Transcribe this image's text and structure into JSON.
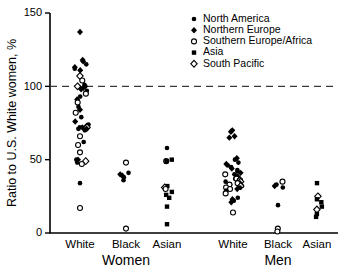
{
  "chart_data": {
    "type": "scatter",
    "title": "",
    "xlabel": "",
    "ylabel": "Ratio to U.S. White women, %",
    "ylim": [
      0,
      150
    ],
    "yticks": [
      0,
      50,
      100,
      150
    ],
    "ytick_labels": [
      "0",
      "50",
      "100",
      "150"
    ],
    "grid": false,
    "legend_position": "top-right",
    "reference_line": {
      "value": 100,
      "style": "dashed",
      "color": "#3a3a3a"
    },
    "group_labels": [
      "Women",
      "Men"
    ],
    "categories": [
      "White",
      "Black",
      "Asian",
      "White",
      "Black",
      "Asian"
    ],
    "category_groups": [
      "Women",
      "Women",
      "Women",
      "Men",
      "Men",
      "Men"
    ],
    "legend": [
      {
        "name": "North America",
        "marker": "filled-circle"
      },
      {
        "name": "Northern Europe",
        "marker": "filled-diamond"
      },
      {
        "name": "Southern Europe/Africa",
        "marker": "open-circle"
      },
      {
        "name": "Asia",
        "marker": "filled-square"
      },
      {
        "name": "South Pacific",
        "marker": "open-diamond"
      }
    ],
    "series": [
      {
        "name": "North America",
        "marker": "filled-circle",
        "points": [
          {
            "category": "Women-White",
            "value": 115
          },
          {
            "category": "Women-White",
            "value": 112
          },
          {
            "category": "Women-White",
            "value": 101
          },
          {
            "category": "Women-White",
            "value": 100
          },
          {
            "category": "Women-White",
            "value": 97
          },
          {
            "category": "Women-White",
            "value": 93
          },
          {
            "category": "Women-White",
            "value": 86
          },
          {
            "category": "Women-White",
            "value": 79
          },
          {
            "category": "Women-White",
            "value": 74
          },
          {
            "category": "Women-White",
            "value": 72
          },
          {
            "category": "Women-White",
            "value": 71
          },
          {
            "category": "Women-White",
            "value": 70
          },
          {
            "category": "Women-White",
            "value": 62
          },
          {
            "category": "Women-White",
            "value": 50
          },
          {
            "category": "Women-White",
            "value": 48
          },
          {
            "category": "Women-White",
            "value": 34
          },
          {
            "category": "Women-Black",
            "value": 41
          },
          {
            "category": "Women-Black",
            "value": 38
          },
          {
            "category": "Women-Black",
            "value": 36
          },
          {
            "category": "Women-Asian",
            "value": 58
          },
          {
            "category": "Men-White",
            "value": 50
          },
          {
            "category": "Men-White",
            "value": 48
          },
          {
            "category": "Men-White",
            "value": 46
          },
          {
            "category": "Men-White",
            "value": 45
          },
          {
            "category": "Men-White",
            "value": 43
          },
          {
            "category": "Men-White",
            "value": 42
          },
          {
            "category": "Men-White",
            "value": 40
          },
          {
            "category": "Men-White",
            "value": 39
          },
          {
            "category": "Men-White",
            "value": 38
          },
          {
            "category": "Men-White",
            "value": 37
          },
          {
            "category": "Men-White",
            "value": 36
          },
          {
            "category": "Men-White",
            "value": 35
          },
          {
            "category": "Men-White",
            "value": 33
          },
          {
            "category": "Men-White",
            "value": 32
          },
          {
            "category": "Men-White",
            "value": 31
          },
          {
            "category": "Men-White",
            "value": 29
          },
          {
            "category": "Men-White",
            "value": 24
          },
          {
            "category": "Men-White",
            "value": 22
          },
          {
            "category": "Men-Black",
            "value": 33
          },
          {
            "category": "Men-Black",
            "value": 31
          },
          {
            "category": "Men-Black",
            "value": 19
          }
        ]
      },
      {
        "name": "Northern Europe",
        "marker": "filled-diamond",
        "points": [
          {
            "category": "Women-White",
            "value": 137
          },
          {
            "category": "Women-White",
            "value": 118
          },
          {
            "category": "Women-White",
            "value": 117
          },
          {
            "category": "Women-White",
            "value": 113
          },
          {
            "category": "Women-White",
            "value": 111
          },
          {
            "category": "Women-White",
            "value": 99
          },
          {
            "category": "Women-White",
            "value": 98
          },
          {
            "category": "Women-White",
            "value": 91
          },
          {
            "category": "Women-White",
            "value": 84
          },
          {
            "category": "Women-White",
            "value": 76
          },
          {
            "category": "Women-White",
            "value": 73
          },
          {
            "category": "Women-White",
            "value": 72
          },
          {
            "category": "Women-White",
            "value": 71
          },
          {
            "category": "Women-White",
            "value": 50
          },
          {
            "category": "Women-Black",
            "value": 40
          },
          {
            "category": "Women-Black",
            "value": 39
          },
          {
            "category": "Men-White",
            "value": 70
          },
          {
            "category": "Men-White",
            "value": 69
          },
          {
            "category": "Men-White",
            "value": 66
          },
          {
            "category": "Men-White",
            "value": 65
          },
          {
            "category": "Men-White",
            "value": 51
          },
          {
            "category": "Men-White",
            "value": 47
          },
          {
            "category": "Men-White",
            "value": 44
          },
          {
            "category": "Men-White",
            "value": 41
          },
          {
            "category": "Men-White",
            "value": 38
          },
          {
            "category": "Men-White",
            "value": 34
          },
          {
            "category": "Men-White",
            "value": 30
          },
          {
            "category": "Men-White",
            "value": 23
          },
          {
            "category": "Men-White",
            "value": 21
          },
          {
            "category": "Men-Black",
            "value": 32
          }
        ]
      },
      {
        "name": "Southern Europe/Africa",
        "marker": "open-circle",
        "points": [
          {
            "category": "Women-White",
            "value": 104
          },
          {
            "category": "Women-White",
            "value": 95
          },
          {
            "category": "Women-White",
            "value": 89
          },
          {
            "category": "Women-White",
            "value": 82
          },
          {
            "category": "Women-White",
            "value": 66
          },
          {
            "category": "Women-White",
            "value": 60
          },
          {
            "category": "Women-White",
            "value": 55
          },
          {
            "category": "Women-White",
            "value": 47
          },
          {
            "category": "Women-White",
            "value": 17
          },
          {
            "category": "Women-Black",
            "value": 48
          },
          {
            "category": "Women-Black",
            "value": 3
          },
          {
            "category": "Women-Asian",
            "value": 49
          },
          {
            "category": "Women-Asian",
            "value": 30
          },
          {
            "category": "Men-White",
            "value": 40
          },
          {
            "category": "Men-White",
            "value": 37
          },
          {
            "category": "Men-White",
            "value": 36
          },
          {
            "category": "Men-White",
            "value": 34
          },
          {
            "category": "Men-White",
            "value": 33
          },
          {
            "category": "Men-White",
            "value": 31
          },
          {
            "category": "Men-White",
            "value": 30
          },
          {
            "category": "Men-White",
            "value": 27
          },
          {
            "category": "Men-White",
            "value": 14
          },
          {
            "category": "Men-Black",
            "value": 35
          },
          {
            "category": "Men-Black",
            "value": 3
          },
          {
            "category": "Men-Black",
            "value": 1
          }
        ]
      },
      {
        "name": "Asia",
        "marker": "filled-square",
        "points": [
          {
            "category": "Women-Asian",
            "value": 50
          },
          {
            "category": "Women-Asian",
            "value": 49
          },
          {
            "category": "Women-Asian",
            "value": 32
          },
          {
            "category": "Women-Asian",
            "value": 28
          },
          {
            "category": "Women-Asian",
            "value": 26
          },
          {
            "category": "Women-Asian",
            "value": 24
          },
          {
            "category": "Women-Asian",
            "value": 18
          },
          {
            "category": "Women-Asian",
            "value": 6
          },
          {
            "category": "Men-Asian",
            "value": 34
          },
          {
            "category": "Men-Asian",
            "value": 23
          },
          {
            "category": "Men-Asian",
            "value": 21
          },
          {
            "category": "Men-Asian",
            "value": 18
          },
          {
            "category": "Men-Asian",
            "value": 13
          },
          {
            "category": "Men-Asian",
            "value": 11
          }
        ]
      },
      {
        "name": "South Pacific",
        "marker": "open-diamond",
        "points": [
          {
            "category": "Women-White",
            "value": 107
          },
          {
            "category": "Women-White",
            "value": 100
          },
          {
            "category": "Women-White",
            "value": 72
          },
          {
            "category": "Women-White",
            "value": 49
          },
          {
            "category": "Women-Asian",
            "value": 31
          },
          {
            "category": "Men-White",
            "value": 35
          },
          {
            "category": "Men-White",
            "value": 32
          },
          {
            "category": "Men-Asian",
            "value": 25
          },
          {
            "category": "Men-Asian",
            "value": 16
          }
        ]
      }
    ]
  }
}
